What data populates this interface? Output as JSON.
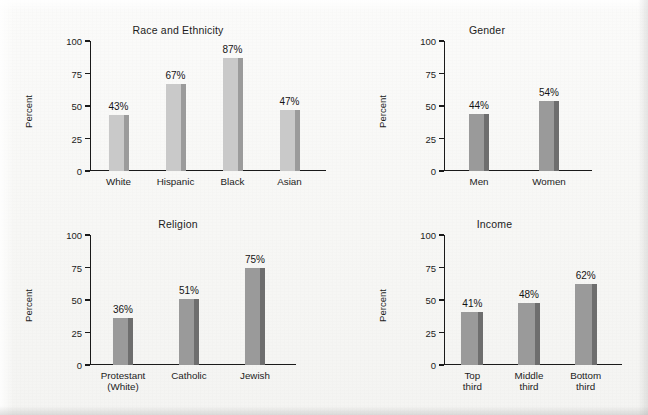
{
  "figure": {
    "background_color": "#f7f7f5",
    "axis_color": "#1a1a1a",
    "text_color": "#1c1c1c"
  },
  "chart_data": [
    {
      "type": "bar",
      "title": "Race and Ethnicity",
      "xlabel": "",
      "ylabel": "Percent",
      "categories": [
        "White",
        "Hispanic",
        "Black",
        "Asian"
      ],
      "values": [
        43,
        67,
        87,
        47
      ],
      "value_labels": [
        "43%",
        "67%",
        "87%",
        "47%"
      ],
      "ylim": [
        0,
        100
      ],
      "yticks": [
        0,
        25,
        50,
        75,
        100
      ],
      "ytick_labels": [
        "0",
        "25",
        "50",
        "75",
        "100"
      ],
      "grid": false,
      "legend": "none",
      "bar_color": "#c9c9c9",
      "bar_shadow_color": "#9b9b9b"
    },
    {
      "type": "bar",
      "title": "Gender",
      "xlabel": "",
      "ylabel": "Percent",
      "categories": [
        "Men",
        "Women"
      ],
      "values": [
        44,
        54
      ],
      "value_labels": [
        "44%",
        "54%"
      ],
      "ylim": [
        0,
        100
      ],
      "yticks": [
        0,
        25,
        50,
        75,
        100
      ],
      "ytick_labels": [
        "0",
        "25",
        "50",
        "75",
        "100"
      ],
      "grid": false,
      "legend": "none",
      "bar_color": "#9a9a9a",
      "bar_shadow_color": "#6e6e6e"
    },
    {
      "type": "bar",
      "title": "Religion",
      "xlabel": "",
      "ylabel": "Percent",
      "categories": [
        "Protestant\n(White)",
        "Catholic",
        "Jewish"
      ],
      "values": [
        36,
        51,
        75
      ],
      "value_labels": [
        "36%",
        "51%",
        "75%"
      ],
      "ylim": [
        0,
        100
      ],
      "yticks": [
        0,
        25,
        50,
        75,
        100
      ],
      "ytick_labels": [
        "0",
        "25",
        "50",
        "75",
        "100"
      ],
      "grid": false,
      "legend": "none",
      "bar_color": "#9a9a9a",
      "bar_shadow_color": "#6e6e6e"
    },
    {
      "type": "bar",
      "title": "Income",
      "xlabel": "",
      "ylabel": "Percent",
      "categories": [
        "Top\nthird",
        "Middle\nthird",
        "Bottom\nthird"
      ],
      "values": [
        41,
        48,
        62
      ],
      "value_labels": [
        "41%",
        "48%",
        "62%"
      ],
      "ylim": [
        0,
        100
      ],
      "yticks": [
        0,
        25,
        50,
        75,
        100
      ],
      "ytick_labels": [
        "0",
        "25",
        "50",
        "75",
        "100"
      ],
      "grid": false,
      "legend": "none",
      "bar_color": "#9a9a9a",
      "bar_shadow_color": "#6e6e6e"
    }
  ]
}
